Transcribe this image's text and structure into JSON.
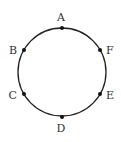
{
  "diagram": {
    "type": "circle-with-points",
    "circle": {
      "cx": 62,
      "cy": 72,
      "r": 44,
      "stroke": "#222222"
    },
    "points": [
      {
        "label": "A",
        "x": 62,
        "y": 28,
        "lx": 61,
        "ly": 21,
        "anchor": "middle"
      },
      {
        "label": "B",
        "x": 24,
        "y": 50,
        "lx": 17,
        "ly": 54,
        "anchor": "end"
      },
      {
        "label": "C",
        "x": 24,
        "y": 94,
        "lx": 17,
        "ly": 99,
        "anchor": "end"
      },
      {
        "label": "D",
        "x": 62,
        "y": 117,
        "lx": 61,
        "ly": 132,
        "anchor": "middle"
      },
      {
        "label": "E",
        "x": 100,
        "y": 94,
        "lx": 106,
        "ly": 99,
        "anchor": "start"
      },
      {
        "label": "F",
        "x": 100,
        "y": 50,
        "lx": 106,
        "ly": 54,
        "anchor": "start"
      }
    ]
  }
}
